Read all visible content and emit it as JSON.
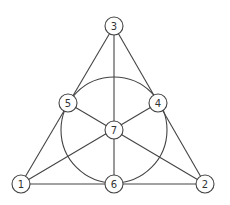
{
  "diagram": {
    "colors": {
      "stroke": "#444444",
      "label": "#333333",
      "background": "#ffffff"
    },
    "node_radius": 9,
    "nodes": [
      {
        "id": "1",
        "label": "1",
        "x": 21,
        "y": 184
      },
      {
        "id": "2",
        "label": "2",
        "x": 205,
        "y": 184
      },
      {
        "id": "3",
        "label": "3",
        "x": 114,
        "y": 26
      },
      {
        "id": "4",
        "label": "4",
        "x": 158,
        "y": 103
      },
      {
        "id": "5",
        "label": "5",
        "x": 68,
        "y": 103
      },
      {
        "id": "6",
        "label": "6",
        "x": 114,
        "y": 184
      },
      {
        "id": "7",
        "label": "7",
        "x": 114,
        "y": 130
      }
    ],
    "lines": [
      [
        "1",
        "5",
        "3"
      ],
      [
        "3",
        "4",
        "2"
      ],
      [
        "1",
        "6",
        "2"
      ],
      [
        "3",
        "7",
        "6"
      ],
      [
        "1",
        "7",
        "4"
      ],
      [
        "2",
        "7",
        "5"
      ]
    ],
    "circle": {
      "through": [
        "4",
        "5",
        "6"
      ],
      "cx": 114,
      "cy": 130,
      "r": 53
    }
  }
}
